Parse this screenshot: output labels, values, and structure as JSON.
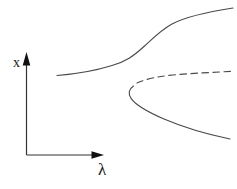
{
  "figure": {
    "type": "bifurcation-diagram-sketch",
    "colors": {
      "background": "#ffffff",
      "curve": "#4a4a4a",
      "axis": "#333333",
      "text": "#1a1a1a"
    },
    "axes": {
      "y": {
        "label": "x",
        "line": "M 26.5 155 L 26.5 64",
        "arrow_points": "26.5,52 22.7,65.5 30.3,65.5",
        "label_x": "16.5",
        "label_y": "67"
      },
      "x": {
        "label": "λ",
        "line": "M 26.5 155 L 93 155",
        "arrow_points": "104,155 91.5,151.2 91.5,158.8",
        "label_x": "102",
        "label_y": "175"
      }
    },
    "curves": [
      {
        "name": "upper-branch",
        "style": "solid",
        "path": "M 57 75.5 C 74 74.2, 96 70.5, 112 65.5 C 126 61.2, 133 56.5, 144 46.5 C 153 38.3, 161 30, 172 24 C 185 17, 207 12, 233 8"
      },
      {
        "name": "middle-branch-dashed",
        "style": "dashed",
        "path": "M 137 83 C 147 78.6, 159 76.3, 173 75 C 193 73.2, 214 72.3, 232 71.3"
      },
      {
        "name": "lower-branch-fold",
        "style": "solid",
        "path": "M 133.5 86 C 129 89, 127.6 93.6, 131.2 98.6 C 136.5 106, 149 112.5, 164 119 C 181 126.3, 206 134, 230 139"
      }
    ]
  }
}
